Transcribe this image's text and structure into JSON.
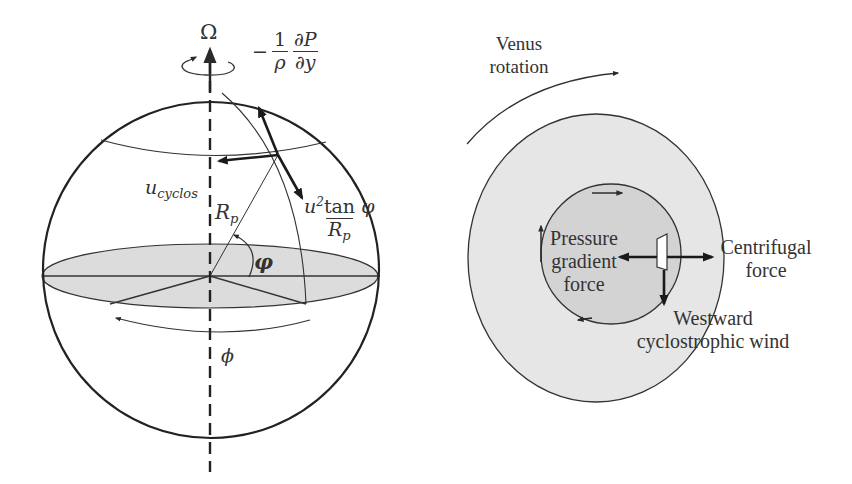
{
  "figure": {
    "left_panel": {
      "name": "rotating-sphere-force-balance",
      "labels": {
        "omega": "Ω",
        "pressure_gradient_prefix": "−",
        "pressure_gradient_frac1_num": "1",
        "pressure_gradient_frac1_den": "ρ",
        "pressure_gradient_frac2_num": "∂P",
        "pressure_gradient_frac2_den": "∂y",
        "u_cyclos_base": "u",
        "u_cyclos_sub": "cyclos",
        "radius_base": "R",
        "radius_sub": "p",
        "centrifugal_num_base": "u",
        "centrifugal_num_sup": "2",
        "centrifugal_num_tan": "tan ",
        "centrifugal_num_phi": "φ",
        "centrifugal_den_base": "R",
        "centrifugal_den_sub": "p",
        "latitude": "φ",
        "longitude": "ϕ"
      }
    },
    "right_panel": {
      "name": "venus-cyclostrophic-balance",
      "labels": {
        "venus_rotation_line1": "Venus",
        "venus_rotation_line2": "rotation",
        "pressure_line1": "Pressure",
        "pressure_line2": "gradient",
        "pressure_line3": "force",
        "centrifugal_line1": "Centrifugal",
        "centrifugal_line2": "force",
        "wind_line1": "Westward",
        "wind_line2": "cyclostrophic wind"
      }
    },
    "colors": {
      "stroke": "#2a2a2a",
      "outer_disk_fill": "#e6e6e6",
      "inner_disk_fill": "#d3d3d3",
      "equator_fill": "#dcdcdc",
      "background": "#ffffff"
    }
  }
}
